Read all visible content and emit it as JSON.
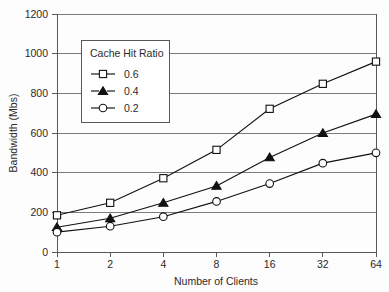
{
  "chart_data": {
    "type": "line",
    "title": "",
    "xlabel": "Number of Clients",
    "ylabel": "Bandwidth (Mbs)",
    "x": [
      1,
      2,
      4,
      8,
      16,
      32,
      64
    ],
    "x_tick_labels": [
      "1",
      "2",
      "4",
      "8",
      "16",
      "32",
      "64"
    ],
    "x_scale": "log2-evenly-spaced",
    "y_tick_labels": [
      "0",
      "200",
      "400",
      "600",
      "800",
      "1000",
      "1200"
    ],
    "y_ticks": [
      0,
      200,
      400,
      600,
      800,
      1000,
      1200
    ],
    "ylim": [
      0,
      1200
    ],
    "grid": "horizontal",
    "legend_position": "upper-left-inside",
    "legend_title": "Cache Hit Ratio",
    "series": [
      {
        "name": "0.6",
        "marker": "open-square",
        "values": [
          185,
          248,
          372,
          515,
          722,
          848,
          960
        ]
      },
      {
        "name": "0.4",
        "marker": "filled-triangle",
        "values": [
          125,
          170,
          248,
          333,
          477,
          600,
          695
        ]
      },
      {
        "name": "0.2",
        "marker": "open-circle",
        "values": [
          100,
          130,
          178,
          255,
          345,
          448,
          500
        ]
      }
    ]
  },
  "colors": {
    "background": "#fdfdfd",
    "axis": "#58585a",
    "grid": "#6e6e70",
    "series": "#111111",
    "text": "#2b2b2b"
  }
}
